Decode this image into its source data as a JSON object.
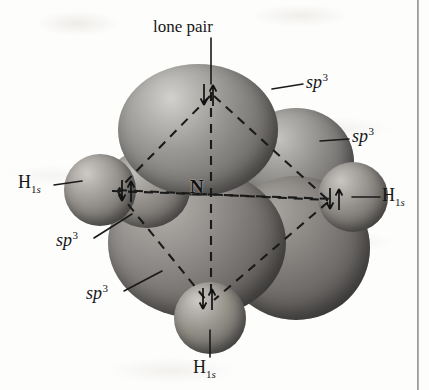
{
  "figure": {
    "molecule": "NH3",
    "central_atom": "N",
    "background_color": "#fdfdfc",
    "orbital_color": "#7c7a77",
    "line_color": "#171717"
  },
  "labels": {
    "lone_pair": "lone pair",
    "sp3_upper_right": "sp",
    "sp3_upper_right_exp": "3",
    "sp3_right": "sp",
    "sp3_right_exp": "3",
    "sp3_lower_left_upper": "sp",
    "sp3_lower_left_upper_exp": "3",
    "sp3_lower_left_lower": "sp",
    "sp3_lower_left_lower_exp": "3",
    "h_left": "H",
    "h_left_sub_number": "1",
    "h_left_sub_orbital": "s",
    "h_right": "H",
    "h_right_sub_number": "1",
    "h_right_sub_orbital": "s",
    "h_bottom": "H",
    "h_bottom_sub_number": "1",
    "h_bottom_sub_orbital": "s",
    "nitrogen": "N"
  },
  "electron_pairs": [
    {
      "name": "lone-pair-electrons",
      "position": "top",
      "spins": "down-up"
    },
    {
      "name": "left-bond-electrons",
      "position": "left",
      "spins": "down-up"
    },
    {
      "name": "right-bond-electrons",
      "position": "right",
      "spins": "down-up"
    },
    {
      "name": "bottom-bond-electrons",
      "position": "bottom",
      "spins": "down-up"
    }
  ],
  "orbital_labels_list": [
    {
      "name": "lone-pair",
      "text": "lone pair"
    },
    {
      "name": "sp3-upper-right",
      "text": "sp3"
    },
    {
      "name": "sp3-right",
      "text": "sp3"
    },
    {
      "name": "sp3-lower-left-upper",
      "text": "sp3"
    },
    {
      "name": "sp3-lower-left-lower",
      "text": "sp3"
    }
  ]
}
